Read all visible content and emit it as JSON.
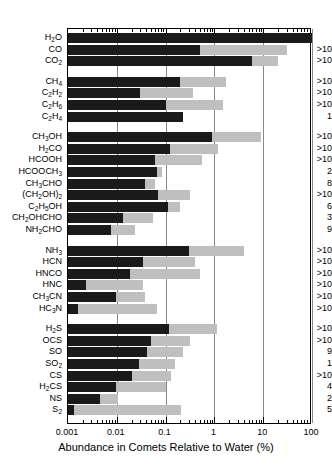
{
  "chart_data": {
    "type": "bar",
    "orientation": "horizontal",
    "title": "",
    "xlabel": "Abundance in Comets Relative to Water (%)",
    "ylabel": "",
    "xscale": "log",
    "xlim": [
      0.001,
      100
    ],
    "xticks": [
      0.001,
      0.01,
      0.1,
      1,
      10,
      100
    ],
    "xticklabels": [
      "0.001",
      "0.01",
      "0.1",
      "1",
      "10",
      "100"
    ],
    "grid": true,
    "grid_axis": "x",
    "legend": null,
    "colors": {
      "dark_bar": "#1a1a1a",
      "light_bar": "#bfbfbf",
      "gridline": "#888888",
      "frame": "#000000",
      "background": "#ffffff"
    },
    "series": [
      {
        "name": "median abundance",
        "style": "dark"
      },
      {
        "name": "maximum abundance",
        "style": "light"
      }
    ],
    "annotation_column_header": "",
    "note": "Each row shows a dark bar (lower/typical value) overlaid on a light bar (upper/maximum value); the right-hand number is the count of comets measured.",
    "groups": [
      {
        "name": "oxides",
        "rows": [
          0,
          1,
          2
        ]
      },
      {
        "name": "hydrocarbons",
        "rows": [
          3,
          4,
          5,
          6
        ]
      },
      {
        "name": "oxygenated",
        "rows": [
          7,
          8,
          9,
          10,
          11,
          12,
          13,
          14,
          15
        ]
      },
      {
        "name": "nitrogenated",
        "rows": [
          16,
          17,
          18,
          19,
          20,
          21
        ]
      },
      {
        "name": "sulfur",
        "rows": [
          22,
          23,
          24,
          25,
          26,
          27,
          28,
          29
        ]
      }
    ],
    "rows": [
      {
        "label": "H2O",
        "label_html": "H<sub>2</sub>O",
        "dark": 100,
        "light": 100,
        "count": ""
      },
      {
        "label": "CO",
        "label_html": "CO",
        "dark": 0.5,
        "light": 30,
        "count": ">10"
      },
      {
        "label": "CO2",
        "label_html": "CO<sub>2</sub>",
        "dark": 6,
        "light": 20,
        "count": ">10"
      },
      {
        "label": "CH4",
        "label_html": "CH<sub>4</sub>",
        "dark": 0.2,
        "light": 1.7,
        "count": ">10"
      },
      {
        "label": "C2H2",
        "label_html": "C<sub>2</sub>H<sub>2</sub>",
        "dark": 0.03,
        "light": 0.36,
        "count": ">10"
      },
      {
        "label": "C2H6",
        "label_html": "C<sub>2</sub>H<sub>6</sub>",
        "dark": 0.1,
        "light": 1.5,
        "count": ">10"
      },
      {
        "label": "C2H4",
        "label_html": "C<sub>2</sub>H<sub>4</sub>",
        "dark": 0.23,
        "light": 0.23,
        "count": "1"
      },
      {
        "label": "CH3OH",
        "label_html": "CH<sub>3</sub>OH",
        "dark": 0.9,
        "light": 9,
        "count": ">10"
      },
      {
        "label": "H2CO",
        "label_html": "H<sub>2</sub>CO",
        "dark": 0.12,
        "light": 1.2,
        "count": ">10"
      },
      {
        "label": "HCOOH",
        "label_html": "HCOOH",
        "dark": 0.06,
        "light": 0.55,
        "count": ">10"
      },
      {
        "label": "HCOOCH3",
        "label_html": "HCOOCH<sub>3</sub>",
        "dark": 0.065,
        "light": 0.085,
        "count": "2"
      },
      {
        "label": "CH3CHO",
        "label_html": "CH<sub>3</sub>CHO",
        "dark": 0.037,
        "light": 0.06,
        "count": "8"
      },
      {
        "label": "(CH2OH)2",
        "label_html": "(CH<sub>2</sub>OH)<sub>2</sub>",
        "dark": 0.07,
        "light": 0.31,
        "count": ">10"
      },
      {
        "label": "C2H5OH",
        "label_html": "C<sub>2</sub>H<sub>5</sub>OH",
        "dark": 0.11,
        "light": 0.2,
        "count": "6"
      },
      {
        "label": "CH2OHCHO",
        "label_html": "CH<sub>2</sub>OHCHO",
        "dark": 0.0135,
        "light": 0.055,
        "count": "3"
      },
      {
        "label": "NH2CHO",
        "label_html": "NH<sub>2</sub>CHO",
        "dark": 0.0076,
        "light": 0.024,
        "count": "9"
      },
      {
        "label": "NH3",
        "label_html": "NH<sub>3</sub>",
        "dark": 0.3,
        "light": 4,
        "count": ">10"
      },
      {
        "label": "HCN",
        "label_html": "HCN",
        "dark": 0.035,
        "light": 0.4,
        "count": ">10"
      },
      {
        "label": "HNCO",
        "label_html": "HNCO",
        "dark": 0.019,
        "light": 0.5,
        "count": ">10"
      },
      {
        "label": "HNC",
        "label_html": "HNC",
        "dark": 0.0023,
        "light": 0.035,
        "count": ">10"
      },
      {
        "label": "CH3CN",
        "label_html": "CH<sub>3</sub>CN",
        "dark": 0.0095,
        "light": 0.038,
        "count": ">10"
      },
      {
        "label": "HC3N",
        "label_html": "HC<sub>3</sub>N",
        "dark": 0.0016,
        "light": 0.068,
        "count": ">10"
      },
      {
        "label": "H2S",
        "label_html": "H<sub>2</sub>S",
        "dark": 0.115,
        "light": 1.15,
        "count": ">10"
      },
      {
        "label": "OCS",
        "label_html": "OCS",
        "dark": 0.05,
        "light": 0.31,
        "count": ">10"
      },
      {
        "label": "SO",
        "label_html": "SO",
        "dark": 0.042,
        "light": 0.23,
        "count": "9"
      },
      {
        "label": "SO2",
        "label_html": "SO<sub>2</sub>",
        "dark": 0.028,
        "light": 0.155,
        "count": "1"
      },
      {
        "label": "CS",
        "label_html": "CS",
        "dark": 0.02,
        "light": 0.13,
        "count": ">10"
      },
      {
        "label": "H2CS",
        "label_html": "H<sub>2</sub>CS",
        "dark": 0.0094,
        "light": 0.1,
        "count": "4"
      },
      {
        "label": "NS",
        "label_html": "NS",
        "dark": 0.0045,
        "light": 0.0105,
        "count": "2"
      },
      {
        "label": "S2",
        "label_html": "S<sub>2</sub>",
        "dark": 0.0013,
        "light": 0.21,
        "count": "5"
      }
    ]
  }
}
